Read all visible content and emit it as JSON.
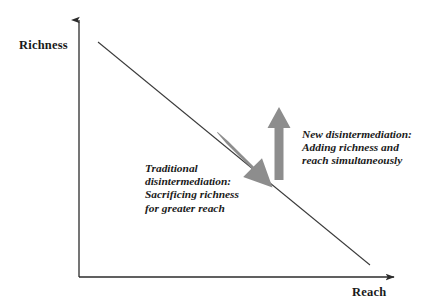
{
  "diagram": {
    "title_text": "",
    "axes": {
      "y_axis_label": "Richness",
      "x_axis_label": "Reach",
      "axis_color": "#2b2b2b",
      "origin": {
        "x": 79,
        "y": 277
      },
      "y_axis_top": {
        "x": 79,
        "y": 17
      },
      "x_axis_right": {
        "x": 398,
        "y": 277
      }
    },
    "tradeoff_line": {
      "name": "richness-reach-tradeoff-line",
      "from": {
        "x": 98,
        "y": 42
      },
      "to": {
        "x": 370,
        "y": 265
      },
      "color": "#3a3a3a"
    },
    "arrows": [
      {
        "id": "traditional-arrow",
        "direction": "down-right",
        "color": "#8d8d8d",
        "from": {
          "x": 222,
          "y": 137
        },
        "to": {
          "x": 271,
          "y": 186
        }
      },
      {
        "id": "new-arrow",
        "direction": "up",
        "color": "#8d8d8d",
        "from": {
          "x": 279,
          "y": 179
        },
        "to": {
          "x": 279,
          "y": 108
        }
      }
    ],
    "annotations": [
      {
        "id": "traditional-disintermediation",
        "lines": [
          "Traditional",
          "disintermediation:",
          "Sacrificing richness",
          "for greater reach"
        ]
      },
      {
        "id": "new-disintermediation",
        "lines": [
          "New disintermediation:",
          "Adding richness and",
          "reach simultaneously"
        ]
      }
    ]
  }
}
